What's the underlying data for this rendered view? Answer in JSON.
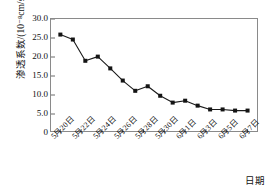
{
  "chart_data": {
    "type": "line",
    "title": "",
    "subtitle": "",
    "xlabel": "日期",
    "ylabel": "渗透系数/(10⁻⁸cm/s)",
    "ylim": [
      0,
      30
    ],
    "y_ticks": [
      "0",
      "5.0",
      "10.0",
      "15.0",
      "20.0",
      "25.0",
      "30.0"
    ],
    "y_tick_values": [
      0,
      5,
      10,
      15,
      20,
      25,
      30
    ],
    "x_tick_labels": [
      "5月20日",
      "5月22日",
      "5月24日",
      "5月26日",
      "5月28日",
      "5月30日",
      "6月1日",
      "6月3日",
      "6月5日",
      "6月7日"
    ],
    "grid": false,
    "legend": "none",
    "marker": "filled-square",
    "series": [
      {
        "name": "渗透系数",
        "x": [
          0,
          1,
          2,
          3,
          4,
          5,
          6,
          7,
          8,
          9,
          10,
          11,
          12,
          13,
          14,
          15
        ],
        "values": [
          25.9,
          24.6,
          19.0,
          20.1,
          17.0,
          13.8,
          11.1,
          12.3,
          9.8,
          8.0,
          8.5,
          7.2,
          6.2,
          6.2,
          5.9,
          5.9
        ]
      }
    ]
  }
}
